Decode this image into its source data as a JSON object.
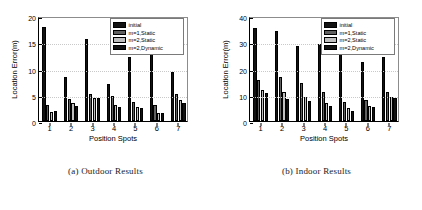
{
  "figure": {
    "subfigures": [
      {
        "caption": "(a) Outdoor Results",
        "chart_index": 0
      },
      {
        "caption": "(b) Indoor Results",
        "chart_index": 1
      }
    ]
  },
  "legend": {
    "position": "top-right",
    "entries": [
      {
        "label": "initial",
        "color": "#121212"
      },
      {
        "label": "m=1,Static",
        "color": "#606060"
      },
      {
        "label": "m=2,Static",
        "color": "#bfbfbf"
      },
      {
        "label": "m=2,Dynamic",
        "color": "#121212"
      }
    ]
  },
  "chart_data": [
    {
      "type": "bar",
      "title": "",
      "subtitle": "(a) Outdoor Results",
      "xlabel": "Position Spots",
      "ylabel": "Location Error(m)",
      "categories": [
        "1",
        "2",
        "3",
        "4",
        "5",
        "6",
        "7"
      ],
      "ylim": [
        0,
        20
      ],
      "yticks": [
        0,
        5,
        10,
        15,
        20
      ],
      "ytick_labels": [
        "0",
        "5",
        "10",
        "15",
        "20"
      ],
      "grid": true,
      "legend_position": "top-right",
      "series": [
        {
          "name": "initial",
          "color": "#121212",
          "values": [
            17.9,
            8.3,
            15.7,
            7.1,
            12.2,
            13.1,
            9.3
          ]
        },
        {
          "name": "m=1,Static",
          "color": "#606060",
          "values": [
            3.05,
            4.2,
            5.2,
            4.75,
            3.6,
            3.1,
            5.15
          ]
        },
        {
          "name": "m=2,Static",
          "color": "#bfbfbf",
          "values": [
            1.75,
            3.45,
            4.3,
            3.0,
            2.6,
            1.6,
            4.05
          ]
        },
        {
          "name": "m=2,Dynamic",
          "color": "#121212",
          "values": [
            1.95,
            2.8,
            4.35,
            2.65,
            2.5,
            1.6,
            3.5
          ]
        }
      ]
    },
    {
      "type": "bar",
      "title": "",
      "subtitle": "(b) Indoor Results",
      "xlabel": "Position Spots",
      "ylabel": "Location Error(m)",
      "categories": [
        "1",
        "2",
        "3",
        "4",
        "5",
        "6",
        "7"
      ],
      "ylim": [
        0,
        40
      ],
      "yticks": [
        0,
        10,
        20,
        30,
        40
      ],
      "ytick_labels": [
        "0",
        "10",
        "20",
        "30",
        "40"
      ],
      "grid": true,
      "legend_position": "top-right",
      "series": [
        {
          "name": "initial",
          "color": "#121212",
          "values": [
            35.5,
            34.3,
            28.5,
            29.5,
            33.8,
            22.3,
            24.4
          ]
        },
        {
          "name": "m=1,Static",
          "color": "#606060",
          "values": [
            15.6,
            16.7,
            14.5,
            11.2,
            7.2,
            8.1,
            10.9
          ]
        },
        {
          "name": "m=2,Static",
          "color": "#bfbfbf",
          "values": [
            12.0,
            11.0,
            9.1,
            6.9,
            4.9,
            5.6,
            9.0
          ]
        },
        {
          "name": "m=2,Dynamic",
          "color": "#121212",
          "values": [
            10.8,
            8.3,
            7.5,
            5.6,
            3.9,
            5.5,
            8.9
          ]
        }
      ]
    }
  ]
}
